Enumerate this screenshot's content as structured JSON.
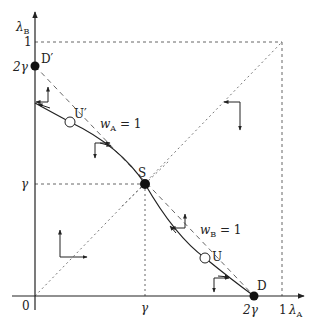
{
  "axes": {
    "x_label": "λ",
    "x_label_sub": "A",
    "y_label": "λ",
    "y_label_sub": "B",
    "origin_label": "0"
  },
  "ticks": {
    "x": [
      {
        "label": "γ",
        "value": "gamma"
      },
      {
        "label": "2γ",
        "value": "2gamma"
      },
      {
        "label": "1",
        "value": "1"
      }
    ],
    "y": [
      {
        "label": "γ",
        "value": "gamma"
      },
      {
        "label": "2γ",
        "value": "2gamma"
      },
      {
        "label": "1",
        "value": "1"
      }
    ]
  },
  "points": [
    {
      "id": "D_prime",
      "label": "D′",
      "type": "filled"
    },
    {
      "id": "U_prime",
      "label": "U′",
      "type": "open"
    },
    {
      "id": "S",
      "label": "S",
      "type": "filled"
    },
    {
      "id": "U",
      "label": "U",
      "type": "open"
    },
    {
      "id": "D",
      "label": "D",
      "type": "filled"
    }
  ],
  "curves": {
    "wA": {
      "label": "w",
      "sub": "A",
      "eq": " = 1"
    },
    "wB": {
      "label": "w",
      "sub": "B",
      "eq": " = 1"
    }
  },
  "colors": {
    "ink": "#222222",
    "dashed": "#555555",
    "background": "#ffffff"
  }
}
